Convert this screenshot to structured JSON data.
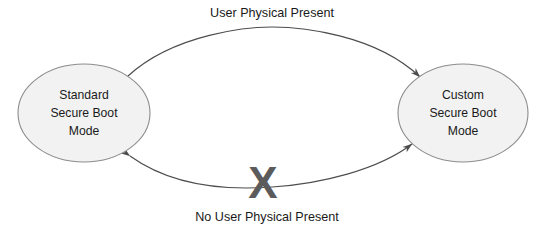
{
  "diagram": {
    "background_color": "#ffffff",
    "nodes": [
      {
        "id": "standard",
        "name": "standard-secure-boot-mode",
        "lines": [
          "Standard",
          "Secure Boot",
          "Mode"
        ],
        "shape": "ellipse",
        "fill_color": "#f2f2f2",
        "stroke_color": "#808080",
        "text_color": "#1a1a1a",
        "cx": 84,
        "cy": 113,
        "rx": 66,
        "ry": 49
      },
      {
        "id": "custom",
        "name": "custom-secure-boot-mode",
        "lines": [
          "Custom",
          "Secure Boot",
          "Mode"
        ],
        "shape": "ellipse",
        "fill_color": "#f2f2f2",
        "stroke_color": "#808080",
        "text_color": "#1a1a1a",
        "cx": 463,
        "cy": 113,
        "rx": 65,
        "ry": 49
      }
    ],
    "edges": [
      {
        "id": "top-edge",
        "name": "edge-user-physical-present",
        "label": "User Physical Present",
        "from": "standard",
        "to": "custom",
        "direction": "bidirectional",
        "stroke_color": "#4d4d4d",
        "blocked": false
      },
      {
        "id": "bottom-edge",
        "name": "edge-no-user-physical-present",
        "label": "No User Physical Present",
        "from": "custom",
        "to": "standard",
        "direction": "bidirectional",
        "stroke_color": "#4d4d4d",
        "blocked": true
      }
    ],
    "markers": [
      {
        "id": "block-x",
        "name": "blocked-transition-x-mark",
        "glyph": "X",
        "color": "#5b5b5b",
        "x": 263,
        "y": 186
      }
    ]
  }
}
